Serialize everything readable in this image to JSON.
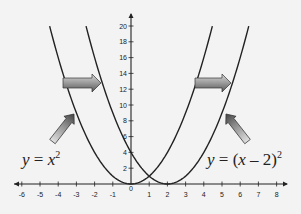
{
  "chart_data": {
    "type": "line",
    "title": "",
    "xlabel": "",
    "ylabel": "",
    "xlim": [
      -6,
      8
    ],
    "ylim": [
      0,
      20
    ],
    "grid": false,
    "x_ticks": [
      -6,
      -5,
      -4,
      -3,
      -2,
      -1,
      0,
      1,
      2,
      3,
      4,
      5,
      6,
      7,
      8
    ],
    "y_ticks": [
      2,
      4,
      6,
      8,
      10,
      12,
      14,
      16,
      18,
      20
    ],
    "series": [
      {
        "name": "y = x^2",
        "function": "x^2",
        "x": [
          -4.47,
          -4,
          -3,
          -2,
          -1,
          0,
          1,
          2,
          3,
          4,
          4.47
        ],
        "y": [
          20,
          16,
          9,
          4,
          1,
          0,
          1,
          4,
          9,
          16,
          20
        ],
        "vertex": [
          0,
          0
        ]
      },
      {
        "name": "y = (x - 2)^2",
        "function": "(x-2)^2",
        "x": [
          -2.47,
          -2,
          -1,
          0,
          1,
          2,
          3,
          4,
          5,
          6,
          6.47
        ],
        "y": [
          20,
          16,
          9,
          4,
          1,
          0,
          1,
          4,
          9,
          16,
          20
        ],
        "vertex": [
          2,
          0
        ]
      }
    ],
    "annotations": [
      {
        "type": "label",
        "text": "y = x²",
        "target_series": "y = x^2",
        "position": [
          -4.5,
          3.5
        ]
      },
      {
        "type": "label",
        "text": "y = (x − 2)²",
        "target_series": "y = (x - 2)^2",
        "position": [
          5.5,
          3.5
        ]
      },
      {
        "type": "arrow",
        "direction": "right",
        "meaning": "horizontal shift by 2 units to the right",
        "y": 13
      },
      {
        "type": "arrow",
        "direction": "right",
        "meaning": "horizontal shift by 2 units to the right",
        "y": 13
      }
    ]
  },
  "labels": {
    "left_eq_y": "y",
    "left_eq_eq": " = ",
    "left_eq_x": "x",
    "left_eq_exp": "2",
    "right_eq_y": "y",
    "right_eq_eq": " = (",
    "right_eq_x": "x",
    "right_eq_rest": " – 2)",
    "right_eq_exp": "2"
  }
}
